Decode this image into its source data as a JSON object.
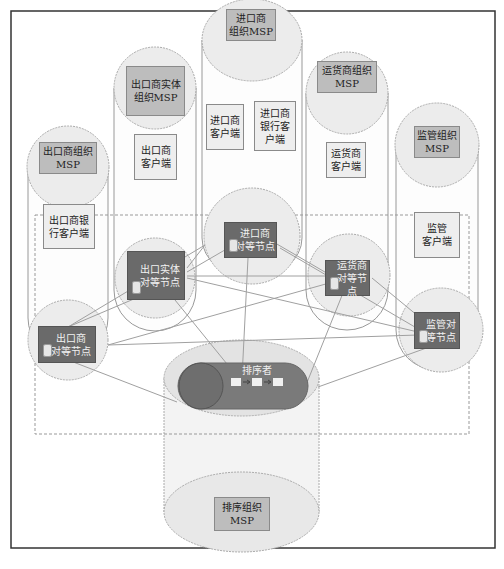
{
  "diagram": {
    "title": "",
    "orgs": [
      {
        "id": "exporter-org",
        "msp": "出口商组织\nMSP",
        "client": "出口商银\n行客户端",
        "peer": "出口商\n对等节点"
      },
      {
        "id": "exporter-entity-org",
        "msp": "出口商实体\n组织MSP",
        "client": "出口商\n客户端",
        "peer": "出口实体\n对等节点"
      },
      {
        "id": "importer-org",
        "msp": "进口商\n组织MSP",
        "client": "进口商\n客户端",
        "client2": "进口商\n银行客\n户端",
        "peer": "进口商\n对等节点"
      },
      {
        "id": "freight-org",
        "msp": "运货商组织\nMSP",
        "client": "运货商\n客户端",
        "peer": "运货商\n对等节点"
      },
      {
        "id": "regulator-org",
        "msp": "监管组织\nMSP",
        "client": "监管\n客户端",
        "peer": "监管对\n等节点"
      }
    ],
    "orderer": {
      "label": "排序者",
      "msp": "排序组织\nMSP",
      "queue_blocks": 3
    },
    "colors": {
      "frame": "#333333",
      "circle_fill": "#ececec",
      "circle_stroke": "#aaaaaa",
      "msp_fill": "#bdbdbd",
      "peer_fill": "#6a6a6a",
      "orderer_fill": "#7a7a7a",
      "line": "#a0a0a0"
    }
  }
}
